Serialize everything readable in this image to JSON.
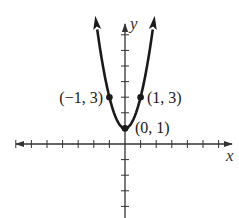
{
  "chart_data": {
    "type": "line",
    "title": "",
    "function": "y = 2x^2 + 1",
    "xlabel": "x",
    "ylabel": "y",
    "xlim": [
      -7,
      7
    ],
    "ylim": [
      -4,
      8
    ],
    "x_ticks": [
      -7,
      -6,
      -5,
      -4,
      -3,
      -2,
      -1,
      1,
      2,
      3,
      4,
      5,
      6
    ],
    "y_ticks": [
      -4,
      -3,
      -2,
      -1,
      1,
      2,
      3,
      4,
      5,
      6,
      7
    ],
    "grid": false,
    "tick_labels_shown": false,
    "series": [
      {
        "name": "parabola",
        "x": [
          -1.9,
          -1.5,
          -1,
          -0.5,
          0,
          0.5,
          1,
          1.5,
          1.9
        ],
        "y": [
          8.22,
          5.5,
          3,
          1.5,
          1,
          1.5,
          3,
          5.5,
          8.22
        ],
        "arrows_at_ends": true
      }
    ],
    "points": [
      {
        "x": -1,
        "y": 3,
        "label": "(−1, 3)"
      },
      {
        "x": 0,
        "y": 1,
        "label": "(0, 1)"
      },
      {
        "x": 1,
        "y": 3,
        "label": "(1, 3)"
      }
    ]
  },
  "labels": {
    "x_axis": "x",
    "y_axis": "y",
    "point_left": "(−1, 3)",
    "point_vertex": "(0, 1)",
    "point_right": "(1, 3)"
  },
  "colors": {
    "curve": "#1a1a1a",
    "axes": "#333333",
    "background": "#ffffff"
  }
}
